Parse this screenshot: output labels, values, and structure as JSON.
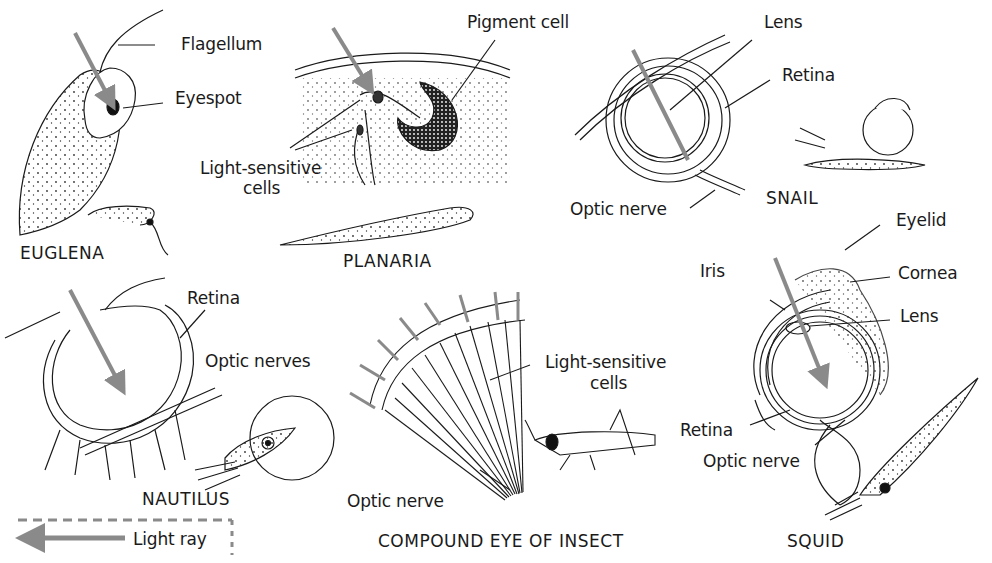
{
  "figure": {
    "colors": {
      "ink": "#1a1a1a",
      "light_ray": "#8a8a8a",
      "background": "#ffffff"
    },
    "panels": [
      {
        "id": "euglena",
        "caption": "EUGLENA",
        "labels": [
          "Flagellum",
          "Eyespot"
        ]
      },
      {
        "id": "planaria",
        "caption": "PLANARIA",
        "labels": [
          "Pigment cell",
          "Light-sensitive",
          "cells"
        ]
      },
      {
        "id": "snail",
        "caption": "SNAIL",
        "labels": [
          "Lens",
          "Retina",
          "Optic nerve"
        ]
      },
      {
        "id": "nautilus",
        "caption": "NAUTILUS",
        "labels": [
          "Retina",
          "Optic nerves"
        ]
      },
      {
        "id": "insect",
        "caption": "COMPOUND EYE OF INSECT",
        "labels": [
          "Light-sensitive",
          "cells",
          "Optic nerve"
        ]
      },
      {
        "id": "squid",
        "caption": "SQUID",
        "labels": [
          "Eyelid",
          "Iris",
          "Cornea",
          "Lens",
          "Retina",
          "Optic nerve"
        ]
      }
    ],
    "legend": {
      "label": "Light ray",
      "icon": "light-ray-arrow-icon"
    }
  }
}
